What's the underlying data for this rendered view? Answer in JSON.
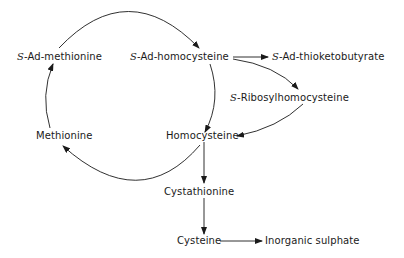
{
  "diagram": {
    "type": "metabolic-pathway",
    "nodes": [
      {
        "id": "sam",
        "prefix": "S",
        "label": "-Ad-methionine"
      },
      {
        "id": "sah",
        "prefix": "S",
        "label": "-Ad-homocysteine"
      },
      {
        "id": "satkb",
        "prefix": "S",
        "label": "-Ad-thioketobutyrate"
      },
      {
        "id": "srh",
        "prefix": "S",
        "label": "-Ribosylhomocysteine"
      },
      {
        "id": "hcy",
        "prefix": "",
        "label": "Homocysteine"
      },
      {
        "id": "met",
        "prefix": "",
        "label": "Methionine"
      },
      {
        "id": "cysta",
        "prefix": "",
        "label": "Cystathionine"
      },
      {
        "id": "cys",
        "prefix": "",
        "label": "Cysteine"
      },
      {
        "id": "so4",
        "prefix": "",
        "label": "Inorganic sulphate"
      }
    ],
    "edges": [
      {
        "from": "sam",
        "to": "sah",
        "style": "arc"
      },
      {
        "from": "sah",
        "to": "hcy",
        "style": "arc"
      },
      {
        "from": "hcy",
        "to": "met",
        "style": "arc"
      },
      {
        "from": "met",
        "to": "sam",
        "style": "arc"
      },
      {
        "from": "sah",
        "to": "satkb",
        "style": "straight"
      },
      {
        "from": "sah",
        "to": "srh",
        "style": "curve"
      },
      {
        "from": "srh",
        "to": "hcy",
        "style": "curve"
      },
      {
        "from": "hcy",
        "to": "cysta",
        "style": "straight"
      },
      {
        "from": "cysta",
        "to": "cys",
        "style": "straight"
      },
      {
        "from": "cys",
        "to": "so4",
        "style": "straight"
      }
    ]
  }
}
